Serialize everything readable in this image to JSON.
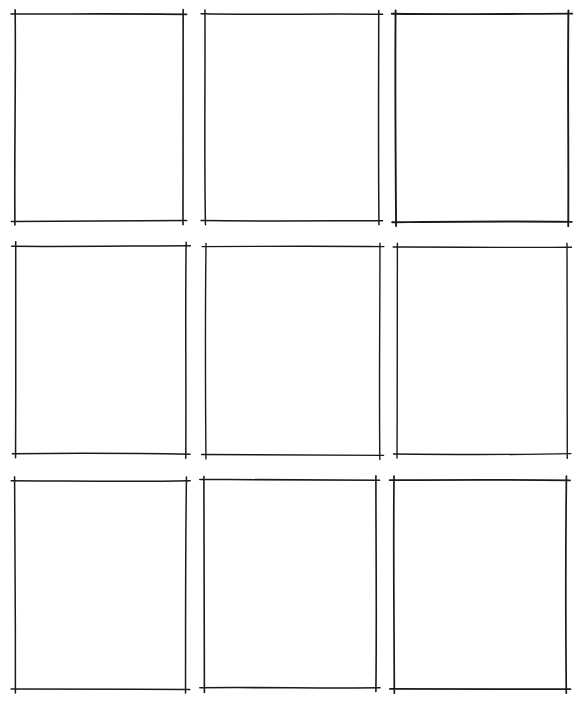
{
  "sheet": {
    "type": "storyboard-panel-grid",
    "rows": 3,
    "columns": 3,
    "background": "#ffffff",
    "line_color": "#1a1a1a",
    "panels": [
      {
        "row": 1,
        "col": 1,
        "x": 15,
        "y": 14,
        "w": 168,
        "h": 207,
        "stroke": 1.6
      },
      {
        "row": 1,
        "col": 2,
        "x": 205,
        "y": 14,
        "w": 174,
        "h": 207,
        "stroke": 1.5
      },
      {
        "row": 1,
        "col": 3,
        "x": 396,
        "y": 14,
        "w": 172,
        "h": 208,
        "stroke": 1.9
      },
      {
        "row": 2,
        "col": 1,
        "x": 16,
        "y": 246,
        "w": 170,
        "h": 208,
        "stroke": 1.5
      },
      {
        "row": 2,
        "col": 2,
        "x": 206,
        "y": 247,
        "w": 174,
        "h": 208,
        "stroke": 1.4
      },
      {
        "row": 2,
        "col": 3,
        "x": 397,
        "y": 247,
        "w": 170,
        "h": 207,
        "stroke": 1.4
      },
      {
        "row": 3,
        "col": 1,
        "x": 15,
        "y": 481,
        "w": 171,
        "h": 208,
        "stroke": 1.5
      },
      {
        "row": 3,
        "col": 2,
        "x": 204,
        "y": 480,
        "w": 172,
        "h": 208,
        "stroke": 1.6
      },
      {
        "row": 3,
        "col": 3,
        "x": 394,
        "y": 480,
        "w": 172,
        "h": 209,
        "stroke": 1.7
      }
    ]
  }
}
